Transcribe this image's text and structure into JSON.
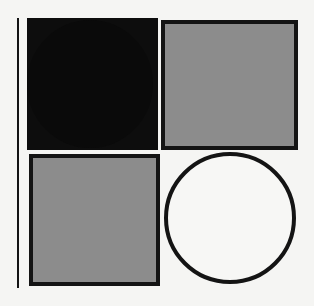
{
  "artwork": {
    "title": "Abstract Geometric Composition",
    "description": "Four-quadrant arrangement of squares and circles in black, gray and white with a thin vertical rule at the left margin.",
    "canvas": {
      "width": 314,
      "height": 306,
      "background_color": "#f5f5f3"
    },
    "palette": {
      "background": "#f5f5f3",
      "black": "#0d0d0d",
      "outline": "#141414",
      "gray_fill": "#8c8c8c",
      "white_fill": "#f7f7f5"
    },
    "shapes": [
      {
        "name": "vertical-rule",
        "type": "line",
        "orientation": "vertical",
        "fill": "#141414",
        "stroke": "none",
        "x": 17,
        "y": 18,
        "width": 2,
        "height": 270,
        "quadrant": "left-margin"
      },
      {
        "name": "black-square",
        "type": "square",
        "fill": "#0d0d0d",
        "stroke": "none",
        "x": 27,
        "y": 18,
        "width": 131,
        "height": 132,
        "quadrant": "top-left"
      },
      {
        "name": "black-circle",
        "type": "circle",
        "fill": "#0a0a0a",
        "stroke": "none",
        "x": 27,
        "y": 20,
        "width": 126,
        "height": 128,
        "center_x": 90,
        "center_y": 84,
        "radius": 63,
        "quadrant": "top-left"
      },
      {
        "name": "gray-square-top-right",
        "type": "square",
        "fill": "#8c8c8c",
        "stroke": "#141414",
        "stroke_width": 4,
        "x": 161,
        "y": 20,
        "width": 137,
        "height": 130,
        "quadrant": "top-right"
      },
      {
        "name": "gray-square-bottom-left",
        "type": "square",
        "fill": "#8c8c8c",
        "stroke": "#141414",
        "stroke_width": 4,
        "x": 29,
        "y": 154,
        "width": 131,
        "height": 132,
        "quadrant": "bottom-left"
      },
      {
        "name": "outline-circle-bottom-right",
        "type": "circle",
        "fill": "#f7f7f5",
        "stroke": "#141414",
        "stroke_width": 4,
        "x": 164,
        "y": 152,
        "width": 132,
        "height": 132,
        "center_x": 230,
        "center_y": 218,
        "radius": 66,
        "quadrant": "bottom-right"
      }
    ]
  }
}
